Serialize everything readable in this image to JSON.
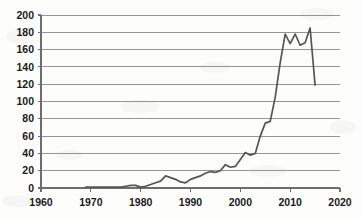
{
  "chart_data": {
    "type": "line",
    "title": "",
    "subtitle": "",
    "xlabel": "",
    "ylabel": "",
    "xlim": [
      1960,
      2020
    ],
    "ylim": [
      0,
      200
    ],
    "grid": true,
    "legend": false,
    "legend_position": "none",
    "line_color": "#555555",
    "x_tick_labels": [
      "1960",
      "1970",
      "1980",
      "1990",
      "2000",
      "2010",
      "2020"
    ],
    "x_ticks": [
      1960,
      1970,
      1980,
      1990,
      2000,
      2010,
      2020
    ],
    "y_tick_labels": [
      "0",
      "20",
      "40",
      "60",
      "80",
      "100",
      "120",
      "140",
      "160",
      "180",
      "200"
    ],
    "y_ticks": [
      0,
      20,
      40,
      60,
      80,
      100,
      120,
      140,
      160,
      180,
      200
    ],
    "series": [
      {
        "name": "series-1",
        "color": "#555555",
        "x": [
          1969,
          1970,
          1971,
          1972,
          1973,
          1974,
          1975,
          1976,
          1977,
          1978,
          1979,
          1980,
          1981,
          1982,
          1983,
          1984,
          1985,
          1986,
          1987,
          1988,
          1989,
          1990,
          1991,
          1992,
          1993,
          1994,
          1995,
          1996,
          1997,
          1998,
          1999,
          2000,
          2001,
          2002,
          2003,
          2004,
          2005,
          2006,
          2007,
          2008,
          2009,
          2010,
          2011,
          2012,
          2013,
          2014,
          2015
        ],
        "y": [
          1,
          1,
          1,
          1,
          1,
          1,
          1,
          1,
          2,
          3,
          3,
          1,
          2,
          4,
          6,
          8,
          14,
          12,
          10,
          7,
          6,
          10,
          12,
          14,
          17,
          19,
          18,
          20,
          27,
          24,
          25,
          33,
          41,
          38,
          40,
          60,
          75,
          77,
          105,
          145,
          178,
          167,
          178,
          165,
          168,
          185,
          119
        ]
      }
    ]
  },
  "axes": {
    "plot_left_px": 41,
    "plot_right_px": 340,
    "plot_top_px": 15,
    "plot_bottom_px": 188
  }
}
